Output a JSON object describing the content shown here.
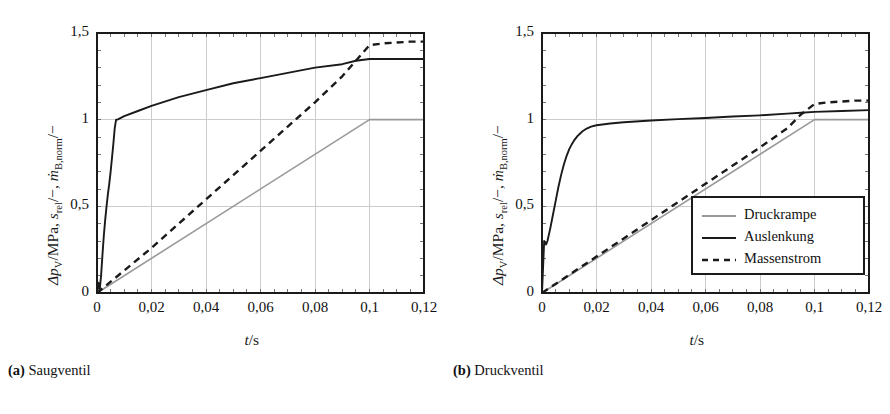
{
  "figure": {
    "panels": [
      {
        "id": "a",
        "caption_tag": "(a)",
        "caption_text": "Saugventil"
      },
      {
        "id": "b",
        "caption_tag": "(b)",
        "caption_text": "Druckventil"
      }
    ]
  },
  "axes": {
    "xlabel_symbol": "t",
    "xlabel_unit": "/s",
    "xlabel_full": "t/s",
    "ylabel_full": "ΔpV /MPa, srel /−, ṁB,norm /−",
    "ylabel_parts": {
      "p1": "Δp",
      "p1sub": "V",
      "p2": "/MPa, ",
      "p3": "s",
      "p3sub": "rel",
      "p4": "/−, ",
      "p5": "ṁ",
      "p5sub": "B,norm",
      "p6": "/−"
    },
    "xticklabels": [
      "0",
      "0,02",
      "0,04",
      "0,06",
      "0,08",
      "0,1",
      "0,12"
    ],
    "yticklabels": [
      "0",
      "0,5",
      "1",
      "1,5"
    ]
  },
  "legend": {
    "entries": [
      {
        "label": "Druckrampe",
        "style": "solid",
        "color": "#999999"
      },
      {
        "label": "Auslenkung",
        "style": "solid",
        "color": "#1a1a1a"
      },
      {
        "label": "Massenstrom",
        "style": "dashed",
        "color": "#1a1a1a"
      }
    ]
  },
  "colors": {
    "druckrampe": "#999999",
    "auslenkung": "#1a1a1a",
    "massenstrom": "#1a1a1a",
    "grid": "#cccccc",
    "frame": "#1a1a1a",
    "background": "#ffffff"
  },
  "chart_data": [
    {
      "type": "line",
      "title": "(a) Saugventil",
      "xlabel": "t/s",
      "ylabel": "ΔpV/MPa, srel/−, ṁB,norm/−",
      "xlim": [
        0,
        0.12
      ],
      "ylim": [
        0,
        1.5
      ],
      "xticks": [
        0,
        0.02,
        0.04,
        0.06,
        0.08,
        0.1,
        0.12
      ],
      "yticks": [
        0,
        0.5,
        1,
        1.5
      ],
      "xticklabels": [
        "0",
        "0,02",
        "0,04",
        "0,06",
        "0,08",
        "0,1",
        "0,12"
      ],
      "yticklabels": [
        "0",
        "0,5",
        "1",
        "1,5"
      ],
      "grid": true,
      "legend_position": "none",
      "series": [
        {
          "name": "Druckrampe",
          "style": "solid",
          "color": "#999999",
          "x": [
            0,
            0.1,
            0.12
          ],
          "y": [
            0,
            1.0,
            1.0
          ]
        },
        {
          "name": "Auslenkung",
          "style": "solid",
          "color": "#1a1a1a",
          "x": [
            0,
            0.0005,
            0.001,
            0.0015,
            0.002,
            0.0025,
            0.003,
            0.0035,
            0.004,
            0.0045,
            0.005,
            0.0055,
            0.006,
            0.0065,
            0.007,
            0.0075,
            0.01,
            0.015,
            0.02,
            0.03,
            0.04,
            0.05,
            0.06,
            0.07,
            0.08,
            0.09,
            0.095,
            0.1,
            0.105,
            0.11,
            0.115,
            0.12
          ],
          "y": [
            0,
            0.06,
            0.02,
            0.1,
            0.22,
            0.33,
            0.42,
            0.5,
            0.57,
            0.63,
            0.7,
            0.78,
            0.86,
            0.95,
            1.0,
            1.0,
            1.02,
            1.05,
            1.08,
            1.13,
            1.17,
            1.21,
            1.24,
            1.27,
            1.3,
            1.32,
            1.34,
            1.35,
            1.35,
            1.35,
            1.35,
            1.35
          ]
        },
        {
          "name": "Massenstrom",
          "style": "dashed",
          "color": "#1a1a1a",
          "x": [
            0,
            0.01,
            0.02,
            0.03,
            0.04,
            0.05,
            0.06,
            0.07,
            0.08,
            0.09,
            0.095,
            0.1,
            0.105,
            0.11,
            0.115,
            0.12
          ],
          "y": [
            0,
            0.13,
            0.26,
            0.4,
            0.54,
            0.68,
            0.82,
            0.96,
            1.1,
            1.25,
            1.34,
            1.43,
            1.44,
            1.445,
            1.45,
            1.45
          ]
        }
      ]
    },
    {
      "type": "line",
      "title": "(b) Druckventil",
      "xlabel": "t/s",
      "ylabel": "ΔpV/MPa, srel/−, ṁB,norm/−",
      "xlim": [
        0,
        0.12
      ],
      "ylim": [
        0,
        1.5
      ],
      "xticks": [
        0,
        0.02,
        0.04,
        0.06,
        0.08,
        0.1,
        0.12
      ],
      "yticks": [
        0,
        0.5,
        1,
        1.5
      ],
      "xticklabels": [
        "0",
        "0,02",
        "0,04",
        "0,06",
        "0,08",
        "0,1",
        "0,12"
      ],
      "yticklabels": [
        "0",
        "0,5",
        "1",
        "1,5"
      ],
      "grid": true,
      "legend_position": "lower-right",
      "series": [
        {
          "name": "Druckrampe",
          "style": "solid",
          "color": "#999999",
          "x": [
            0,
            0.1,
            0.12
          ],
          "y": [
            0,
            1.0,
            1.0
          ]
        },
        {
          "name": "Auslenkung",
          "style": "solid",
          "color": "#1a1a1a",
          "x": [
            0,
            0.0008,
            0.0015,
            0.002,
            0.003,
            0.004,
            0.005,
            0.006,
            0.007,
            0.008,
            0.009,
            0.01,
            0.011,
            0.012,
            0.013,
            0.014,
            0.015,
            0.016,
            0.018,
            0.02,
            0.025,
            0.03,
            0.04,
            0.05,
            0.06,
            0.07,
            0.08,
            0.09,
            0.095,
            0.1,
            0.11,
            0.12
          ],
          "y": [
            0,
            0.3,
            0.28,
            0.3,
            0.37,
            0.45,
            0.53,
            0.61,
            0.68,
            0.74,
            0.79,
            0.83,
            0.86,
            0.885,
            0.905,
            0.92,
            0.935,
            0.945,
            0.96,
            0.968,
            0.978,
            0.985,
            0.995,
            1.003,
            1.01,
            1.018,
            1.025,
            1.035,
            1.04,
            1.045,
            1.05,
            1.055
          ]
        },
        {
          "name": "Massenstrom",
          "style": "dashed",
          "color": "#1a1a1a",
          "x": [
            0,
            0.01,
            0.02,
            0.03,
            0.04,
            0.05,
            0.06,
            0.07,
            0.08,
            0.09,
            0.095,
            0.1,
            0.105,
            0.11,
            0.115,
            0.12
          ],
          "y": [
            0,
            0.105,
            0.21,
            0.315,
            0.42,
            0.525,
            0.63,
            0.735,
            0.84,
            0.95,
            1.03,
            1.09,
            1.1,
            1.105,
            1.11,
            1.11
          ]
        }
      ]
    }
  ]
}
